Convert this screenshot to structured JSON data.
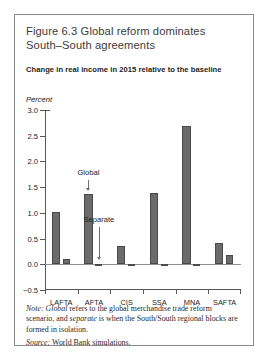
{
  "figure": {
    "title": "Figure 6.3  Global reform dominates South–South agreements",
    "subtitle": "Change in real income in 2015 relative to the baseline",
    "unit_label": "Percent",
    "note_prefix": "Note:",
    "note_italic_1": "Global",
    "note_text_1": " refers to the global merchandise trade reform scenario, and ",
    "note_italic_2": "separate",
    "note_text_2": " is when the South/South regional blocks are formed in isolation.",
    "source_prefix": "Source:",
    "source_text": " World Bank simulations."
  },
  "chart_data": {
    "type": "bar",
    "title": "Figure 6.3  Global reform dominates South–South agreements",
    "subtitle": "Change in real income in 2015 relative to the baseline",
    "xlabel": "",
    "ylabel": "Percent",
    "ylim": [
      -0.5,
      3.0
    ],
    "yticks": [
      -0.5,
      0.0,
      0.5,
      1.0,
      1.5,
      2.0,
      2.5,
      3.0
    ],
    "ytick_labels": [
      "−0.5",
      "0.0",
      "0.5",
      "1.0",
      "1.5",
      "2.0",
      "2.5",
      "3.0"
    ],
    "grid": false,
    "legend": "none",
    "categories": [
      "LAFTA",
      "AFTA",
      "CIS",
      "SSA",
      "MNA",
      "SAFTA"
    ],
    "series": [
      {
        "name": "Global",
        "values": [
          1.02,
          1.37,
          0.35,
          1.38,
          2.69,
          0.42
        ]
      },
      {
        "name": "Separate",
        "values": [
          0.11,
          0.0,
          -0.02,
          -0.01,
          0.01,
          0.19
        ]
      }
    ],
    "annotations": [
      {
        "text": "Global",
        "category": "AFTA",
        "series": "Global"
      },
      {
        "text": "Separate",
        "category": "AFTA",
        "series": "Separate"
      }
    ],
    "bar_color": "#6b6b6b",
    "bar_edge_color": "#4a4a4a",
    "axis_color": "#55595c"
  }
}
